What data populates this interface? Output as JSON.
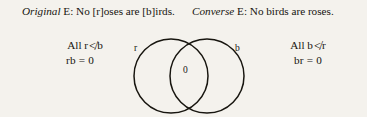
{
  "page": {
    "background_color": "#f4f2ed",
    "text_color": "#17150f"
  },
  "prose": {
    "left": {
      "label": "Original",
      "body": " E: No [r]oses are [b]irds."
    },
    "right": {
      "label": "Converse",
      "body": " E: No birds are roses."
    }
  },
  "formulas": {
    "left": {
      "line1_prefix": "All r",
      "line1_symbol": "≮",
      "line1_suffix": "b",
      "line2": "rb = 0"
    },
    "right": {
      "line1_prefix": "All b",
      "line1_symbol": "≮",
      "line1_suffix": "r",
      "line2": "br = 0"
    }
  },
  "diagram": {
    "type": "venn-two-circle",
    "left_circle_label": "r",
    "right_circle_label": "b",
    "intersection_label": "0",
    "stroke_color": "#17150f",
    "fill": "none"
  }
}
